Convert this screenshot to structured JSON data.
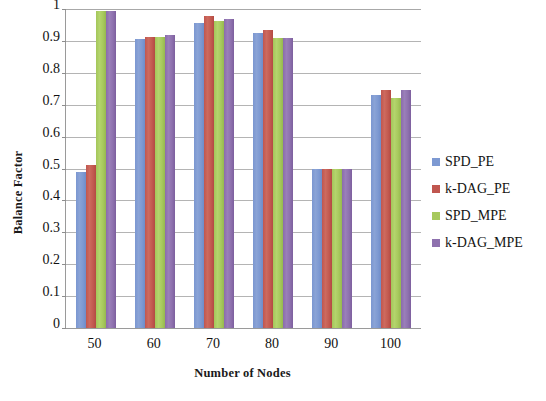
{
  "chart_data": {
    "type": "bar",
    "title": "",
    "xlabel": "Number of Nodes",
    "ylabel": "Balance Factor",
    "categories": [
      "50",
      "60",
      "70",
      "80",
      "90",
      "100"
    ],
    "ylim": [
      0,
      1
    ],
    "ytick_labels": [
      "0",
      "0.1",
      "0.2",
      "0.3",
      "0.4",
      "0.5",
      "0.6",
      "0.7",
      "0.8",
      "0.9",
      "1"
    ],
    "ytick_values": [
      0,
      0.1,
      0.2,
      0.3,
      0.4,
      0.5,
      0.6,
      0.7,
      0.8,
      0.9,
      1
    ],
    "grid": true,
    "legend_position": "right",
    "series": [
      {
        "name": "SPD_PE",
        "color": "#7d99d2",
        "values": [
          0.49,
          0.905,
          0.955,
          0.925,
          0.5,
          0.73
        ]
      },
      {
        "name": "k-DAG_PE",
        "color": "#c0564f",
        "values": [
          0.51,
          0.912,
          0.978,
          0.935,
          0.5,
          0.745
        ]
      },
      {
        "name": "SPD_MPE",
        "color": "#a7c95d",
        "values": [
          0.995,
          0.912,
          0.963,
          0.908,
          0.5,
          0.72
        ]
      },
      {
        "name": "k-DAG_MPE",
        "color": "#8e71ae",
        "values": [
          0.995,
          0.92,
          0.97,
          0.908,
          0.5,
          0.745
        ]
      }
    ]
  },
  "legend": {
    "items": [
      {
        "label": "SPD_PE"
      },
      {
        "label": "k-DAG_PE"
      },
      {
        "label": "SPD_MPE"
      },
      {
        "label": "k-DAG_MPE"
      }
    ]
  },
  "axes": {
    "y_title": "Balance Factor",
    "x_title": "Number of Nodes"
  }
}
